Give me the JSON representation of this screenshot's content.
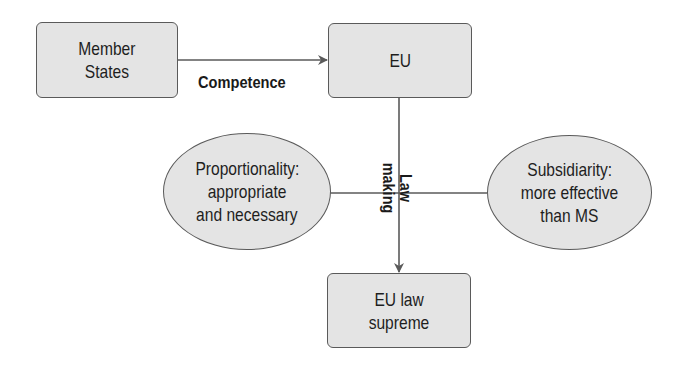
{
  "diagram": {
    "nodes": [
      {
        "id": "member-states",
        "shape": "rounded-rectangle",
        "lines": [
          "Member",
          "States"
        ]
      },
      {
        "id": "eu",
        "shape": "rounded-rectangle",
        "lines": [
          "EU"
        ]
      },
      {
        "id": "proportionality",
        "shape": "ellipse",
        "lines": [
          "Proportionality:",
          "appropriate",
          "and necessary"
        ]
      },
      {
        "id": "subsidiarity",
        "shape": "ellipse",
        "lines": [
          "Subsidiarity:",
          "more effective",
          "than MS"
        ]
      },
      {
        "id": "eu-law-supreme",
        "shape": "rounded-rectangle",
        "lines": [
          "EU law",
          "supreme"
        ]
      }
    ],
    "edges": [
      {
        "from": "member-states",
        "to": "eu",
        "label": "Competence",
        "arrow": true
      },
      {
        "from": "eu",
        "to": "eu-law-supreme",
        "label_lines": [
          "Law",
          "making"
        ],
        "arrow": true,
        "label_rotation": "90deg"
      },
      {
        "from": "proportionality",
        "to": "subsidiarity",
        "label": "",
        "arrow": false
      }
    ]
  },
  "colors": {
    "node_fill": "#e4e4e4",
    "node_border": "#5a5a5a",
    "line": "#5a5a5a",
    "text": "#1e1e1e",
    "background": "#ffffff"
  }
}
